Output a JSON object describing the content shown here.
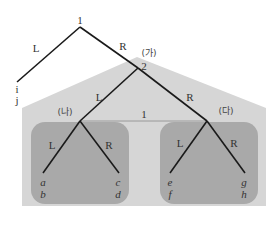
{
  "diagram": {
    "type": "game-tree",
    "colors": {
      "background": "#ffffff",
      "outer_region": "#d6d6d6",
      "inner_region": "#a9a9a9",
      "edge": "#1a1a1a",
      "text": "#333333"
    },
    "root": {
      "player_label": "1"
    },
    "root_branches": {
      "left": "L",
      "right": "R"
    },
    "terminal_root_left": {
      "payoff_top": "i",
      "payoff_bottom": "j"
    },
    "subgame_ga": {
      "label": "(가)",
      "player_label": "2",
      "left": "L",
      "right": "R"
    },
    "subgame_na": {
      "label": "(나)",
      "left": "L",
      "right": "R"
    },
    "subgame_da": {
      "label": "(다)",
      "left": "L",
      "right": "R"
    },
    "info_set": {
      "player_label": "1"
    },
    "leaves": [
      {
        "top": "a",
        "bottom": "b"
      },
      {
        "top": "c",
        "bottom": "d"
      },
      {
        "top": "e",
        "bottom": "f"
      },
      {
        "top": "g",
        "bottom": "h"
      }
    ]
  }
}
